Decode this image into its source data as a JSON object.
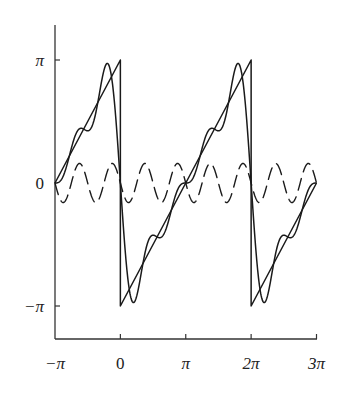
{
  "chart_data": {
    "type": "line",
    "title": "",
    "xlabel": "",
    "ylabel": "",
    "xlim": [
      -3.14159,
      9.42478
    ],
    "ylim": [
      -3.14159,
      3.14159
    ],
    "grid": false,
    "legend": null,
    "x_ticks": [
      {
        "value": -3.14159,
        "label": "−π"
      },
      {
        "value": 0,
        "label": "0"
      },
      {
        "value": 3.14159,
        "label": "π"
      },
      {
        "value": 6.28319,
        "label": "2π"
      },
      {
        "value": 9.42478,
        "label": "3π"
      }
    ],
    "y_ticks": [
      {
        "value": 3.14159,
        "label": "π"
      },
      {
        "value": 0,
        "label": "0"
      },
      {
        "value": -3.14159,
        "label": "−π"
      }
    ],
    "series": [
      {
        "name": "sawtooth f(x) = x − π on (0, 2π), period 2π",
        "kind": "sawtooth",
        "style": "solid",
        "x_range": [
          -3.14159,
          9.42478
        ],
        "key_points": [
          [
            -3.14159,
            0
          ],
          [
            0,
            3.14159
          ],
          [
            0,
            -3.14159
          ],
          [
            6.28319,
            3.14159
          ],
          [
            6.28319,
            -3.14159
          ],
          [
            9.42478,
            0
          ]
        ]
      },
      {
        "name": "Fourier partial sum S4(x) = −2 Σ_{n=1..4} sin(nx)/n",
        "kind": "fourier_partial_sum",
        "style": "solid",
        "terms": 4,
        "x_range": [
          -3.14159,
          9.42478
        ]
      },
      {
        "name": "4th harmonic −(1/2) sin(4x)",
        "kind": "harmonic",
        "style": "dashed",
        "n": 4,
        "amplitude": -0.5,
        "x_range": [
          -3.14159,
          9.42478
        ]
      }
    ]
  },
  "axes": {
    "x_tick_labels": [
      "−π",
      "0",
      "π",
      "2π",
      "3π"
    ],
    "y_tick_labels": [
      "π",
      "0",
      "−π"
    ]
  }
}
